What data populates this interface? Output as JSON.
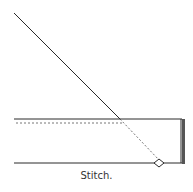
{
  "figure": {
    "caption": "Stitch.",
    "colors": {
      "line": "#2a2a2a",
      "edge_bar": "#555555",
      "dashed": "#777777",
      "background": "#ffffff"
    }
  }
}
